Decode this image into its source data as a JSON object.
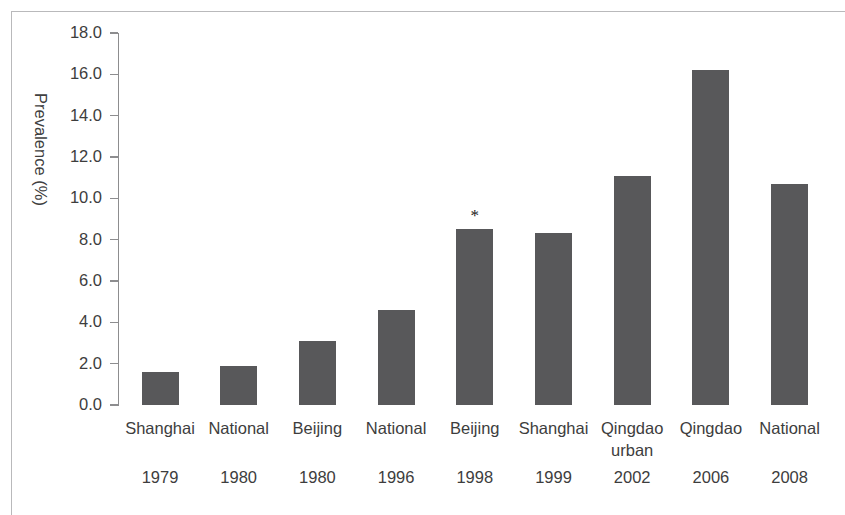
{
  "chart_data": {
    "type": "bar",
    "title": "",
    "subtitle": "",
    "xlabel": "",
    "ylabel": "Prevalence (%)",
    "ylim": [
      0.0,
      18.0
    ],
    "ytick_step": 2.0,
    "yticks": [
      "0.0",
      "2.0",
      "4.0",
      "6.0",
      "8.0",
      "10.0",
      "12.0",
      "14.0",
      "16.0",
      "18.0"
    ],
    "ytick_values": [
      0.0,
      2.0,
      4.0,
      6.0,
      8.0,
      10.0,
      12.0,
      14.0,
      16.0,
      18.0
    ],
    "grid": false,
    "legend": null,
    "legend_position": "none",
    "bar_color": "#58585a",
    "axis_color": "#8d8d8f",
    "text_color": "#3d3d3d",
    "categories": [
      "Shanghai",
      "National",
      "Beijing",
      "National",
      "Beijing",
      "Shanghai",
      "Qingdao urban",
      "Qingdao",
      "National"
    ],
    "category_lines": [
      [
        "Shanghai"
      ],
      [
        "National"
      ],
      [
        "Beijing"
      ],
      [
        "National"
      ],
      [
        "Beijing"
      ],
      [
        "Shanghai"
      ],
      [
        "Qingdao",
        "urban"
      ],
      [
        "Qingdao"
      ],
      [
        "National"
      ]
    ],
    "years": [
      "1979",
      "1980",
      "1980",
      "1996",
      "1998",
      "1999",
      "2002",
      "2006",
      "2008"
    ],
    "values": [
      1.6,
      1.9,
      3.1,
      4.6,
      8.5,
      8.3,
      11.1,
      16.2,
      10.7
    ],
    "annotations": [
      {
        "index": 4,
        "text": "*"
      }
    ]
  }
}
